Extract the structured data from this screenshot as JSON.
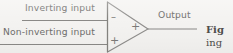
{
  "figure": {
    "kind": "schematic-diagram",
    "background_color": "#f4f3f1",
    "ink_color": "#7a7977",
    "labels": {
      "inverting_input": "Inverting input",
      "non_inverting_input": "Non-inverting input",
      "output": "Output"
    },
    "terminal_signs": {
      "inverting": "–",
      "non_inverting": "+",
      "apex": "+"
    },
    "caption": {
      "line1": "Fig",
      "line2": "ing"
    }
  }
}
